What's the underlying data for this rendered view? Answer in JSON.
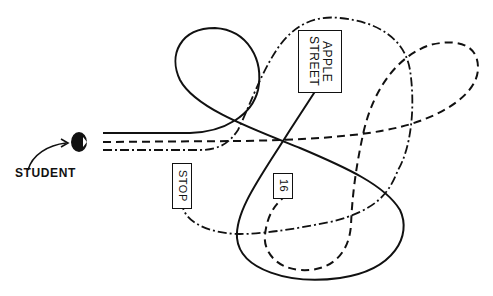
{
  "diagram": {
    "labels": {
      "student": "STUDENT",
      "apple_street": "APPLE\nSTREET",
      "stop": "STOP",
      "sixteen": "16"
    },
    "paths": [
      {
        "name": "solid-path",
        "style": "solid"
      },
      {
        "name": "dashed-path",
        "style": "dashed"
      },
      {
        "name": "dash-dot-path",
        "style": "dash-dot"
      }
    ],
    "colors": {
      "ink": "#111111",
      "background": "#ffffff"
    }
  }
}
